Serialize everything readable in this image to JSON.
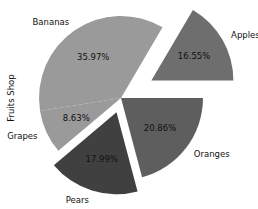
{
  "chart_data": {
    "type": "pie",
    "title": "",
    "ylabel": "Fruits Shop",
    "start_angle_deg": 0,
    "direction": "counterclockwise",
    "autopct_format": "%.2f%%",
    "slices": [
      {
        "label": "Apples",
        "percent": 16.55,
        "pct_text": "16.55%",
        "color": "#6e6e6e",
        "explode": 35
      },
      {
        "label": "Bananas",
        "percent": 35.97,
        "pct_text": "35.97%",
        "color": "#9a9a9a",
        "explode": 0
      },
      {
        "label": "Grapes",
        "percent": 8.63,
        "pct_text": "8.63%",
        "color": "#9a9a9a",
        "explode": 0
      },
      {
        "label": "Pears",
        "percent": 17.99,
        "pct_text": "17.99%",
        "color": "#404040",
        "explode": 15
      },
      {
        "label": "Oranges",
        "percent": 20.86,
        "pct_text": "20.86%",
        "color": "#5e5e5e",
        "explode": 0
      }
    ],
    "categories": [
      "Apples",
      "Bananas",
      "Grapes",
      "Pears",
      "Oranges"
    ],
    "values": [
      16.55,
      35.97,
      8.63,
      17.99,
      20.86
    ],
    "legend": "none",
    "grid": false
  },
  "layout": {
    "center_x": 121,
    "center_y": 98,
    "radius": 82,
    "pct_distance": 0.6,
    "label_distance": 1.12
  }
}
